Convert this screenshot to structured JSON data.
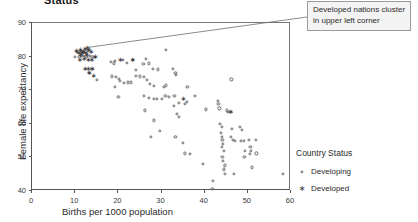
{
  "chart_data": {
    "type": "scatter",
    "title": "Status",
    "xlabel": "Births per 1000 population",
    "ylabel": "Female life expectancy",
    "xlim": [
      0,
      60
    ],
    "ylim": [
      40,
      90
    ],
    "xticks": [
      0,
      10,
      20,
      30,
      40,
      50,
      60
    ],
    "yticks": [
      40,
      50,
      60,
      70,
      80,
      90
    ],
    "grid": false,
    "legend_position": "right",
    "legend_title": "Country Status",
    "annotations": [
      {
        "text": "Developed nations cluster in upper left corner",
        "points_to": [
          13.5,
          82.5
        ]
      }
    ],
    "series": [
      {
        "name": "Developing",
        "marker": "open-circle",
        "color": "#6b6b6b",
        "points": [
          [
            10.0,
            80.0
          ],
          [
            10.4,
            81.5
          ],
          [
            11.0,
            80.0
          ],
          [
            11.3,
            81.6
          ],
          [
            11.6,
            80.1
          ],
          [
            12.0,
            81.6
          ],
          [
            12.1,
            80.2
          ],
          [
            12.6,
            80.0
          ],
          [
            13.0,
            81.6
          ],
          [
            13.4,
            80.1
          ],
          [
            14.0,
            80.0
          ],
          [
            14.6,
            80.0
          ],
          [
            15.0,
            73.0
          ],
          [
            13.2,
            75.2
          ],
          [
            14.1,
            76.4
          ],
          [
            18.3,
            78.5
          ],
          [
            19.0,
            78.0
          ],
          [
            19.2,
            78.7
          ],
          [
            21.0,
            79.0
          ],
          [
            22.0,
            78.2
          ],
          [
            23.3,
            79.0
          ],
          [
            26.4,
            79.2
          ],
          [
            27.0,
            78.0
          ],
          [
            28.0,
            76.3
          ],
          [
            29.2,
            76.2
          ],
          [
            32.6,
            76.3
          ],
          [
            33.2,
            75.2
          ],
          [
            33.4,
            74.6
          ],
          [
            25.8,
            77.8
          ],
          [
            24.0,
            76.0
          ],
          [
            18.6,
            74.1
          ],
          [
            19.4,
            74.0
          ],
          [
            20.1,
            73.3
          ],
          [
            20.4,
            72.8
          ],
          [
            21.3,
            72.2
          ],
          [
            22.2,
            72.3
          ],
          [
            23.0,
            72.3
          ],
          [
            24.1,
            74.2
          ],
          [
            25.0,
            74.1
          ],
          [
            26.0,
            74.0
          ],
          [
            26.6,
            73.0
          ],
          [
            27.4,
            71.9
          ],
          [
            28.3,
            71.2
          ],
          [
            30.6,
            71.0
          ],
          [
            31.1,
            71.4
          ],
          [
            36.0,
            71.1
          ],
          [
            19.3,
            71.1
          ],
          [
            20.0,
            68.1
          ],
          [
            26.0,
            68.2
          ],
          [
            27.1,
            67.6
          ],
          [
            28.2,
            67.4
          ],
          [
            29.0,
            67.3
          ],
          [
            30.1,
            67.5
          ],
          [
            30.9,
            68.2
          ],
          [
            31.8,
            68.0
          ],
          [
            33.0,
            68.3
          ],
          [
            34.0,
            66.2
          ],
          [
            35.4,
            66.0
          ],
          [
            35.8,
            66.6
          ],
          [
            37.8,
            68.3
          ],
          [
            32.8,
            65.4
          ],
          [
            33.6,
            63.0
          ],
          [
            34.1,
            62.0
          ],
          [
            26.2,
            64.0
          ],
          [
            28.3,
            61.0
          ],
          [
            29.6,
            58.0
          ],
          [
            27.6,
            56.0
          ],
          [
            33.2,
            56.0
          ],
          [
            35.0,
            54.2
          ],
          [
            35.4,
            51.2
          ],
          [
            36.6,
            51.0
          ],
          [
            39.6,
            48.0
          ],
          [
            40.2,
            64.3
          ],
          [
            41.8,
            40.7
          ],
          [
            42.0,
            43.0
          ],
          [
            43.0,
            66.9
          ],
          [
            43.2,
            66.0
          ],
          [
            43.4,
            64.6
          ],
          [
            43.6,
            60.0
          ],
          [
            43.9,
            59.0
          ],
          [
            43.8,
            57.2
          ],
          [
            43.9,
            56.2
          ],
          [
            44.1,
            55.1
          ],
          [
            44.2,
            54.0
          ],
          [
            44.0,
            53.2
          ],
          [
            44.4,
            52.0
          ],
          [
            44.1,
            50.2
          ],
          [
            44.3,
            49.0
          ],
          [
            44.6,
            47.6
          ],
          [
            44.4,
            46.4
          ],
          [
            44.6,
            45.2
          ],
          [
            45.2,
            64.0
          ],
          [
            45.4,
            63.5
          ],
          [
            45.8,
            63.6
          ],
          [
            46.2,
            73.2
          ],
          [
            46.4,
            58.6
          ],
          [
            46.0,
            56.0
          ],
          [
            46.6,
            55.2
          ],
          [
            47.0,
            55.0
          ],
          [
            46.8,
            45.0
          ],
          [
            48.2,
            59.0
          ],
          [
            48.6,
            58.2
          ],
          [
            48.4,
            55.0
          ],
          [
            49.0,
            54.8
          ],
          [
            49.4,
            52.0
          ],
          [
            49.2,
            50.1
          ],
          [
            50.2,
            55.2
          ],
          [
            50.6,
            53.2
          ],
          [
            50.8,
            52.0
          ],
          [
            50.4,
            51.0
          ],
          [
            51.0,
            47.0
          ],
          [
            51.8,
            55.2
          ],
          [
            52.0,
            51.2
          ],
          [
            58.2,
            45.0
          ],
          [
            31.0,
            82.0
          ]
        ]
      },
      {
        "name": "Developed",
        "marker": "asterisk",
        "color": "#2b2b2b",
        "points": [
          [
            10.2,
            81.6
          ],
          [
            10.8,
            81.0
          ],
          [
            11.1,
            82.0
          ],
          [
            11.5,
            81.0
          ],
          [
            11.2,
            80.6
          ],
          [
            11.8,
            81.5
          ],
          [
            12.2,
            82.2
          ],
          [
            12.4,
            81.0
          ],
          [
            12.8,
            82.5
          ],
          [
            12.6,
            80.6
          ],
          [
            13.1,
            82.0
          ],
          [
            13.6,
            81.4
          ],
          [
            11.0,
            79.0
          ],
          [
            12.0,
            79.2
          ],
          [
            13.0,
            79.0
          ],
          [
            13.8,
            79.1
          ],
          [
            14.6,
            80.0
          ],
          [
            12.2,
            76.2
          ],
          [
            13.0,
            76.3
          ],
          [
            13.8,
            76.2
          ],
          [
            13.2,
            75.1
          ],
          [
            14.2,
            74.2
          ],
          [
            20.4,
            79.0
          ],
          [
            23.2,
            79.0
          ],
          [
            35.0,
            67.4
          ],
          [
            46.0,
            63.4
          ]
        ]
      }
    ]
  },
  "annotation": {
    "text": "Developed nations cluster in upper left corner"
  },
  "legend": {
    "title": "Country Status",
    "items": [
      {
        "label": "Developing",
        "marker": "open-circle-icon"
      },
      {
        "label": "Developed",
        "marker": "asterisk-icon"
      }
    ]
  }
}
